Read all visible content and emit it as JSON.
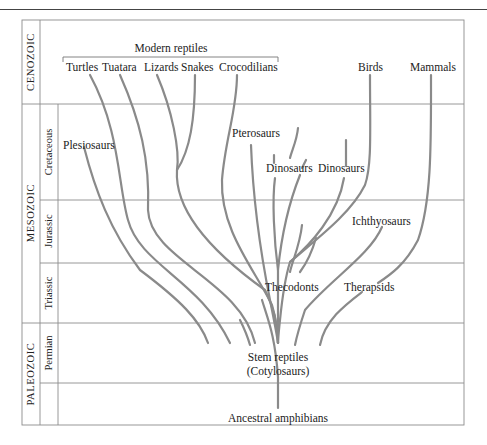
{
  "figure": {
    "title_bracket_label": "Modern reptiles",
    "eras": [
      {
        "name": "CENOZOIC"
      },
      {
        "name": "MESOZOIC"
      },
      {
        "name": "PALEOZOIC"
      }
    ],
    "periods": [
      {
        "name": "Cretaceous",
        "era": "MESOZOIC"
      },
      {
        "name": "Jurassic",
        "era": "MESOZOIC"
      },
      {
        "name": "Triassic",
        "era": "MESOZOIC"
      },
      {
        "name": "Permian",
        "era": "PALEOZOIC"
      }
    ],
    "taxa": {
      "turtles": "Turtles",
      "tuatara": "Tuatara",
      "lizards": "Lizards",
      "snakes": "Snakes",
      "crocodilians": "Crocodilians",
      "birds": "Birds",
      "mammals": "Mammals",
      "plesiosaurs": "Plesiosaurs",
      "pterosaurs": "Pterosaurs",
      "dinosaurs_1": "Dinosaurs",
      "dinosaurs_2": "Dinosaurs",
      "ichthyosaurs": "Ichthyosaurs",
      "thecodonts": "Thecodonts",
      "therapsids": "Therapsids",
      "stem_reptiles": "Stem reptiles",
      "stem_reptiles_alt": "(Cotylosaurs)",
      "ancestral_amphibians": "Ancestral amphibians"
    },
    "colors": {
      "branch": "#8a8a8a",
      "grid": "#8c8c8c",
      "text": "#222222"
    }
  }
}
